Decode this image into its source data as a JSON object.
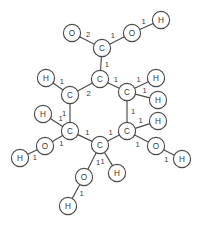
{
  "diagram": {
    "type": "molecule-graph",
    "atom_radius": 8.6,
    "colors": {
      "background": "#ffffff",
      "stroke": "#4a4a4a",
      "text": "#3a3a3a"
    },
    "atoms": [
      {
        "id": "O1",
        "label": "O",
        "x": 72,
        "y": 33
      },
      {
        "id": "C1",
        "label": "C",
        "x": 102,
        "y": 48
      },
      {
        "id": "O2",
        "label": "O",
        "x": 132,
        "y": 33
      },
      {
        "id": "H1",
        "label": "H",
        "x": 161,
        "y": 20
      },
      {
        "id": "H2",
        "label": "H",
        "x": 46,
        "y": 78
      },
      {
        "id": "C2",
        "label": "C",
        "x": 70,
        "y": 95
      },
      {
        "id": "C3",
        "label": "C",
        "x": 100,
        "y": 79
      },
      {
        "id": "C4",
        "label": "C",
        "x": 127,
        "y": 92
      },
      {
        "id": "H3",
        "label": "H",
        "x": 156,
        "y": 78
      },
      {
        "id": "H4",
        "label": "H",
        "x": 158,
        "y": 100
      },
      {
        "id": "H5",
        "label": "H",
        "x": 43,
        "y": 114
      },
      {
        "id": "C5",
        "label": "C",
        "x": 70,
        "y": 131
      },
      {
        "id": "C6",
        "label": "C",
        "x": 100,
        "y": 145
      },
      {
        "id": "C7",
        "label": "C",
        "x": 127,
        "y": 131
      },
      {
        "id": "H6",
        "label": "H",
        "x": 158,
        "y": 121
      },
      {
        "id": "O3",
        "label": "O",
        "x": 45,
        "y": 146
      },
      {
        "id": "H7",
        "label": "H",
        "x": 20,
        "y": 158
      },
      {
        "id": "O4",
        "label": "O",
        "x": 156,
        "y": 146
      },
      {
        "id": "H8",
        "label": "H",
        "x": 182,
        "y": 159
      },
      {
        "id": "O5",
        "label": "O",
        "x": 84,
        "y": 177
      },
      {
        "id": "H9",
        "label": "H",
        "x": 68,
        "y": 206
      },
      {
        "id": "H10",
        "label": "H",
        "x": 117,
        "y": 173
      }
    ],
    "bonds": [
      {
        "from": "O1",
        "to": "C1",
        "order": "2",
        "label_t": 0.4,
        "label_off": -6
      },
      {
        "from": "C1",
        "to": "O2",
        "order": "1",
        "label_t": 0.4,
        "label_off": -6
      },
      {
        "from": "O2",
        "to": "H1",
        "order": "1",
        "label_t": 0.46,
        "label_off": -6
      },
      {
        "from": "C1",
        "to": "C3",
        "order": "1",
        "label_t": 0.52,
        "label_off": -6
      },
      {
        "from": "H2",
        "to": "C2",
        "order": "1",
        "label_t": 0.55,
        "label_off": -6
      },
      {
        "from": "C2",
        "to": "C3",
        "order": "2",
        "label_t": 0.52,
        "label_off": 7
      },
      {
        "from": "C3",
        "to": "C4",
        "order": "1",
        "label_t": 0.48,
        "label_off": -6
      },
      {
        "from": "C4",
        "to": "H3",
        "order": "1",
        "label_t": 0.48,
        "label_off": -6
      },
      {
        "from": "C4",
        "to": "H4",
        "order": "1",
        "label_t": 0.55,
        "label_off": -6
      },
      {
        "from": "C2",
        "to": "C5",
        "order": "1",
        "label_t": 0.5,
        "label_off": 6
      },
      {
        "from": "C4",
        "to": "C7",
        "order": "1",
        "label_t": 0.5,
        "label_off": -6
      },
      {
        "from": "H5",
        "to": "C5",
        "order": "1",
        "label_t": 0.58,
        "label_off": -6
      },
      {
        "from": "C5",
        "to": "O3",
        "order": "1",
        "label_t": 0.42,
        "label_off": -6
      },
      {
        "from": "O3",
        "to": "H7",
        "order": "1",
        "label_t": 0.52,
        "label_off": -6
      },
      {
        "from": "C5",
        "to": "C6",
        "order": "1",
        "label_t": 0.48,
        "label_off": -6
      },
      {
        "from": "C6",
        "to": "C7",
        "order": "1",
        "label_t": 0.5,
        "label_off": -6
      },
      {
        "from": "C7",
        "to": "H6",
        "order": "1",
        "label_t": 0.5,
        "label_off": -6
      },
      {
        "from": "C7",
        "to": "O4",
        "order": "1",
        "label_t": 0.45,
        "label_off": 7
      },
      {
        "from": "O4",
        "to": "H8",
        "order": "1",
        "label_t": 0.55,
        "label_off": 7
      },
      {
        "from": "C6",
        "to": "O5",
        "order": "1",
        "label_t": 0.4,
        "label_off": -6
      },
      {
        "from": "O5",
        "to": "H9",
        "order": "1",
        "label_t": 0.45,
        "label_off": -6
      },
      {
        "from": "C6",
        "to": "H10",
        "order": "1",
        "label_t": 0.42,
        "label_off": 6
      }
    ]
  }
}
